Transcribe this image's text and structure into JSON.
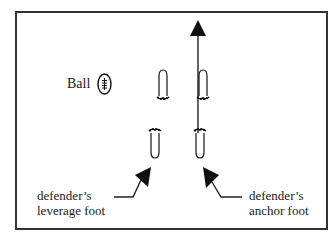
{
  "diagram": {
    "ball_label": "Ball",
    "left_callout": {
      "line1": "defender’s",
      "line2": "leverage foot"
    },
    "right_callout": {
      "line1": "defender’s",
      "line2": "anchor foot"
    },
    "icons": {
      "ball": "football-icon",
      "direction_arrow": "arrow-up-icon",
      "feet": "footprint-icon",
      "pointer_arrows": "pointer-arrow-icon"
    },
    "colors": {
      "ink": "#111111",
      "border": "#333333",
      "background": "#ffffff"
    }
  }
}
